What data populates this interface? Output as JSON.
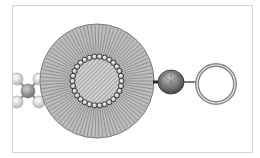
{
  "diagram": {
    "type": "schematic-illustration",
    "colors": {
      "background": "#ffffff",
      "frame_border": "#d4d4d4",
      "sphere_fill": "#bdbdbd",
      "sphere_stroke": "#7a7a7a",
      "bead_fill": "#d8d8d8",
      "bead_stroke": "#2e2e2e",
      "core_fill": "#c8c8c8",
      "polyhedron_fill": "#7d7d7d",
      "ring_stroke": "#8a8a8a",
      "linker": "#222222"
    },
    "components": [
      {
        "name": "molecular-cluster",
        "position": "left"
      },
      {
        "name": "striated-sphere",
        "position": "center"
      },
      {
        "name": "bead-ring",
        "position": "center",
        "bead_count": 30
      },
      {
        "name": "hatched-core",
        "position": "center"
      },
      {
        "name": "faceted-polyhedron",
        "position": "right-center"
      },
      {
        "name": "open-ring",
        "position": "right"
      }
    ]
  }
}
